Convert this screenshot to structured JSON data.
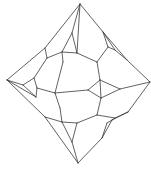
{
  "diagram": {
    "stroke_color": "#3a3a3a",
    "background": "#ffffff",
    "vertices": {
      "T": [
        80,
        4
      ],
      "L": [
        7,
        80
      ],
      "R": [
        150,
        82
      ],
      "B": [
        78,
        163
      ],
      "ut1": [
        72,
        33
      ],
      "ut2": [
        62,
        52
      ],
      "ut3": [
        77,
        53
      ],
      "ut4": [
        63,
        62
      ],
      "ul1": [
        45,
        48
      ],
      "ul2": [
        47,
        58
      ],
      "lt1": [
        23,
        85
      ],
      "lt2": [
        34,
        78
      ],
      "lt3": [
        37,
        88
      ],
      "lt4": [
        36,
        97
      ],
      "c1": [
        55,
        93
      ],
      "ur0": [
        97,
        62
      ],
      "ur1": [
        103,
        32
      ],
      "ur2": [
        108,
        47
      ],
      "ur3": [
        115,
        50
      ],
      "ur4": [
        127,
        60
      ],
      "rt1": [
        100,
        80
      ],
      "rt2": [
        88,
        90
      ],
      "rt3": [
        101,
        98
      ],
      "rt4": [
        120,
        89
      ],
      "lr1": [
        128,
        112
      ],
      "lr2": [
        115,
        118
      ],
      "lr3": [
        112,
        120
      ],
      "lr4": [
        107,
        123
      ],
      "lr5": [
        102,
        138
      ],
      "lb0": [
        97,
        115
      ],
      "bt1": [
        77,
        123
      ],
      "bt2": [
        62,
        122
      ],
      "bt3": [
        72,
        142
      ],
      "ll1": [
        60,
        108
      ],
      "ll2": [
        45,
        117
      ]
    },
    "edges": [
      [
        "T",
        "ut1"
      ],
      [
        "T",
        "ur1"
      ],
      [
        "T",
        "ul1"
      ],
      [
        "T",
        "ut3"
      ],
      [
        "ut1",
        "ut2"
      ],
      [
        "ut1",
        "ut3"
      ],
      [
        "ut2",
        "ut3"
      ],
      [
        "ut2",
        "ut4"
      ],
      [
        "ut2",
        "ul2"
      ],
      [
        "ul1",
        "ul2"
      ],
      [
        "ul1",
        "L"
      ],
      [
        "ut3",
        "ur0"
      ],
      [
        "ut4",
        "c1"
      ],
      [
        "ur1",
        "ur2"
      ],
      [
        "ur1",
        "ur3"
      ],
      [
        "ur2",
        "ur3"
      ],
      [
        "ur2",
        "ur0"
      ],
      [
        "ur3",
        "ur4"
      ],
      [
        "ur4",
        "R"
      ],
      [
        "ur1",
        "ur4"
      ],
      [
        "ur0",
        "rt1"
      ],
      [
        "L",
        "lt1"
      ],
      [
        "L",
        "lt4"
      ],
      [
        "L",
        "ll2"
      ],
      [
        "lt1",
        "lt2"
      ],
      [
        "lt1",
        "lt4"
      ],
      [
        "lt2",
        "lt3"
      ],
      [
        "lt2",
        "ul2"
      ],
      [
        "lt3",
        "lt4"
      ],
      [
        "lt3",
        "c1"
      ],
      [
        "c1",
        "rt2"
      ],
      [
        "c1",
        "ll1"
      ],
      [
        "rt1",
        "rt2"
      ],
      [
        "rt1",
        "rt3"
      ],
      [
        "rt1",
        "rt4"
      ],
      [
        "rt2",
        "rt3"
      ],
      [
        "rt3",
        "rt4"
      ],
      [
        "rt4",
        "R"
      ],
      [
        "rt3",
        "lb0"
      ],
      [
        "R",
        "lr1"
      ],
      [
        "lr1",
        "lr2"
      ],
      [
        "lr2",
        "lr3"
      ],
      [
        "lr3",
        "lr4"
      ],
      [
        "lr2",
        "lb0"
      ],
      [
        "lr4",
        "lr5"
      ],
      [
        "lr3",
        "lr5"
      ],
      [
        "lr5",
        "B"
      ],
      [
        "lr1",
        "lr3"
      ],
      [
        "lb0",
        "bt1"
      ],
      [
        "ll1",
        "bt2"
      ],
      [
        "ll2",
        "bt2"
      ],
      [
        "ll2",
        "B"
      ],
      [
        "bt1",
        "bt2"
      ],
      [
        "bt1",
        "bt3"
      ],
      [
        "bt2",
        "bt3"
      ],
      [
        "bt3",
        "B"
      ]
    ]
  }
}
